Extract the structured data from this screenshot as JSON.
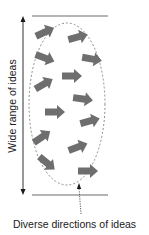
{
  "diagram": {
    "axis_label": "Wide range of ideas",
    "caption": "Diverse directions of ideas",
    "colors": {
      "arrow_fill": "#6e6e6e",
      "bar": "#b4b4b4",
      "axis": "#1a1a1a",
      "ellipse": "#808080"
    },
    "arrows": [
      {
        "x": 45,
        "y": 32,
        "angle": -25
      },
      {
        "x": 78,
        "y": 37,
        "angle": -15
      },
      {
        "x": 45,
        "y": 58,
        "angle": 20
      },
      {
        "x": 92,
        "y": 59,
        "angle": 10
      },
      {
        "x": 44,
        "y": 84,
        "angle": -30
      },
      {
        "x": 72,
        "y": 76,
        "angle": 0
      },
      {
        "x": 83,
        "y": 99,
        "angle": 8
      },
      {
        "x": 55,
        "y": 112,
        "angle": 0
      },
      {
        "x": 90,
        "y": 121,
        "angle": -15
      },
      {
        "x": 42,
        "y": 137,
        "angle": -35
      },
      {
        "x": 78,
        "y": 147,
        "angle": -20
      },
      {
        "x": 47,
        "y": 163,
        "angle": 40
      },
      {
        "x": 88,
        "y": 171,
        "angle": 0
      }
    ]
  }
}
